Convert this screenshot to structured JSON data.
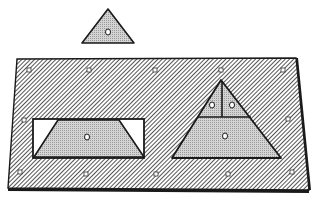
{
  "figure": {
    "colors": {
      "background": "#ffffff",
      "outline": "#1a1a1a",
      "hatch": "#2a2a2a",
      "piece_fill": "#c8c8c8",
      "cutout_empty": "#ffffff"
    },
    "loose_piece": {
      "shape": "triangle",
      "knob_count": 1
    },
    "board": {
      "peg_holes": 12,
      "insets": [
        {
          "shape": "trapezoid-in-rectangle",
          "knob_count": 1
        },
        {
          "shape": "triangle-divided",
          "pieces": 3,
          "knob_count": 3
        }
      ]
    }
  }
}
